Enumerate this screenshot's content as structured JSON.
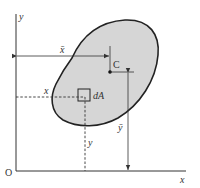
{
  "diagram": {
    "colors": {
      "area_fill": "#d6d6d6",
      "outline": "#222222",
      "axis": "#333333",
      "background": "#ffffff"
    },
    "labels": {
      "origin": "O",
      "x_axis": "x",
      "y_axis": "y",
      "x_bar": "x̄",
      "y_bar": "ȳ",
      "centroid": "C",
      "element": "dA",
      "x_coord": "x",
      "y_coord": "y"
    }
  }
}
